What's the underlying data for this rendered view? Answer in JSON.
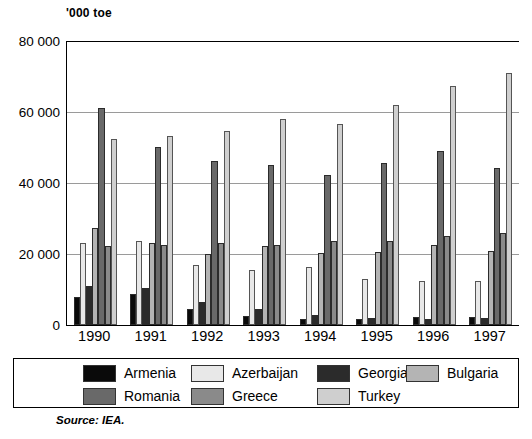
{
  "figure": {
    "unit_label": "'000 toe",
    "source_note": "Source: IEA."
  },
  "chart_data": {
    "type": "bar",
    "title": "",
    "subtitle": "",
    "xlabel": "",
    "ylabel": "'000 toe",
    "ylim": [
      0,
      80000
    ],
    "ytick_labels": [
      "80 000",
      "60 000",
      "40 000",
      "20 000",
      "0"
    ],
    "ytick_values": [
      80000,
      60000,
      40000,
      20000,
      0
    ],
    "grid": true,
    "legend_position": "bottom",
    "categories": [
      "1990",
      "1991",
      "1992",
      "1993",
      "1994",
      "1995",
      "1996",
      "1997"
    ],
    "series": [
      {
        "name": "Armenia",
        "color": "#0a0a0a",
        "values": [
          8000,
          8600,
          4600,
          2600,
          1700,
          1800,
          2200,
          2200
        ]
      },
      {
        "name": "Azerbaijan",
        "color": "#e8e8e8",
        "values": [
          23100,
          23800,
          16800,
          15400,
          16400,
          13000,
          12400,
          12300
        ]
      },
      {
        "name": "Georgia",
        "color": "#2b2b2b",
        "values": [
          11000,
          10400,
          6500,
          4600,
          2900,
          2100,
          1800,
          2000
        ]
      },
      {
        "name": "Bulgaria",
        "color": "#b4b4b4",
        "values": [
          27400,
          23000,
          20100,
          22300,
          20300,
          20500,
          22400,
          20800
        ]
      },
      {
        "name": "Romania",
        "color": "#696969",
        "values": [
          61200,
          50200,
          46200,
          45000,
          42200,
          45600,
          49000,
          44200
        ]
      },
      {
        "name": "Greece",
        "color": "#8a8a8a",
        "values": [
          22300,
          22600,
          23000,
          22600,
          23700,
          23700,
          25200,
          25800
        ]
      },
      {
        "name": "Turkey",
        "color": "#cfcfcf",
        "values": [
          52500,
          53300,
          54700,
          58000,
          56700,
          62000,
          67400,
          71000
        ]
      }
    ]
  },
  "legend": {
    "rows": [
      [
        {
          "label": "Armenia",
          "color": "#0a0a0a"
        },
        {
          "label": "Azerbaijan",
          "color": "#e8e8e8"
        },
        {
          "label": "Georgia",
          "color": "#2b2b2b"
        },
        {
          "label": "Bulgaria",
          "color": "#b4b4b4"
        }
      ],
      [
        {
          "label": "Romania",
          "color": "#696969"
        },
        {
          "label": "Greece",
          "color": "#8a8a8a"
        },
        {
          "label": "Turkey",
          "color": "#cfcfcf"
        }
      ]
    ]
  }
}
